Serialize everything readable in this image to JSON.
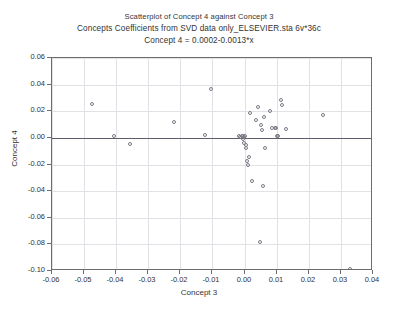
{
  "chart_data": {
    "type": "scatter",
    "title": "Scatterplot of Concept 4 against Concept 3",
    "subtitle": "Concepts Coefficients from SVD data only_ELSEVIER.sta 6v*36c",
    "equation": "Concept 4 = 0.0002-0.0013*x",
    "xlabel": "Concept 3",
    "ylabel": "Concept 4",
    "xlim": [
      -0.06,
      0.04
    ],
    "ylim": [
      -0.1,
      0.06
    ],
    "xticks": [
      -0.06,
      -0.05,
      -0.04,
      -0.03,
      -0.02,
      -0.01,
      0.0,
      0.01,
      0.02,
      0.03,
      0.04
    ],
    "xticklabels": [
      "-0.06",
      "-0.05",
      "-0.04",
      "-0.03",
      "-0.02",
      "-0.01",
      "0.00",
      "0.01",
      "0.02",
      "0.03",
      "0.04"
    ],
    "yticks": [
      0.06,
      0.04,
      0.02,
      0.0,
      -0.02,
      -0.04,
      -0.06,
      -0.08,
      -0.1
    ],
    "yticklabels": [
      "0.06",
      "0.04",
      "0.02",
      "0.00",
      "-0.02",
      "-0.04",
      "-0.06",
      "-0.08",
      "-0.10"
    ],
    "grid": true,
    "legend": false,
    "marker": "open-circle",
    "marker_color": "#7b7b88",
    "fit_line": {
      "intercept": 0.0002,
      "slope": -0.0013,
      "color": "#5c5c6a"
    },
    "points": [
      {
        "x": -0.0472,
        "y": 0.0248
      },
      {
        "x": -0.0403,
        "y": 0.0003
      },
      {
        "x": -0.0355,
        "y": -0.0052
      },
      {
        "x": -0.0218,
        "y": 0.0109
      },
      {
        "x": -0.012,
        "y": 0.0013
      },
      {
        "x": -0.0102,
        "y": 0.0357
      },
      {
        "x": -0.0015,
        "y": 0.0004
      },
      {
        "x": -0.0011,
        "y": 0.0001
      },
      {
        "x": -0.0006,
        "y": 0.001
      },
      {
        "x": -0.0003,
        "y": 0.0007
      },
      {
        "x": -0.0002,
        "y": -0.0018
      },
      {
        "x": 0.0001,
        "y": 0.0002
      },
      {
        "x": 0.0002,
        "y": -0.0045
      },
      {
        "x": 0.0004,
        "y": 0.0003
      },
      {
        "x": 0.0006,
        "y": -0.006
      },
      {
        "x": 0.0009,
        "y": -0.0084
      },
      {
        "x": 0.0011,
        "y": -0.018
      },
      {
        "x": 0.0013,
        "y": -0.0208
      },
      {
        "x": 0.0016,
        "y": -0.0154
      },
      {
        "x": 0.0021,
        "y": 0.0182
      },
      {
        "x": 0.0026,
        "y": -0.033
      },
      {
        "x": 0.004,
        "y": 0.0128
      },
      {
        "x": 0.0046,
        "y": 0.0224
      },
      {
        "x": 0.0051,
        "y": -0.0788
      },
      {
        "x": 0.0054,
        "y": 0.009
      },
      {
        "x": 0.0057,
        "y": 0.0048
      },
      {
        "x": 0.006,
        "y": -0.0366
      },
      {
        "x": 0.0063,
        "y": 0.0148
      },
      {
        "x": 0.0068,
        "y": -0.0083
      },
      {
        "x": 0.0082,
        "y": 0.0192
      },
      {
        "x": 0.009,
        "y": 0.0069
      },
      {
        "x": 0.0097,
        "y": 0.0068
      },
      {
        "x": 0.01,
        "y": 0.007
      },
      {
        "x": 0.0104,
        "y": 0.0007
      },
      {
        "x": 0.0108,
        "y": 0.0004
      },
      {
        "x": 0.0118,
        "y": 0.0279
      },
      {
        "x": 0.012,
        "y": 0.0243
      },
      {
        "x": 0.0132,
        "y": 0.0058
      },
      {
        "x": 0.0248,
        "y": 0.0165
      },
      {
        "x": 0.0332,
        "y": -0.0995
      }
    ]
  }
}
